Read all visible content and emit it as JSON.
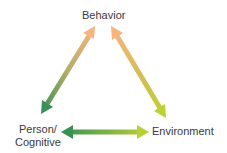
{
  "diagram": {
    "type": "triangle-reciprocal-determinism",
    "nodes": {
      "top": "Behavior",
      "left_line1": "Person/",
      "left_line2": "Cognitive",
      "right": "Environment"
    },
    "edges": [
      {
        "from": "Behavior",
        "to": "Person/Cognitive",
        "direction": "bidirectional"
      },
      {
        "from": "Behavior",
        "to": "Environment",
        "direction": "bidirectional"
      },
      {
        "from": "Person/Cognitive",
        "to": "Environment",
        "direction": "bidirectional"
      }
    ],
    "colors": {
      "orange": "#f5b27a",
      "green": "#3f9a5a",
      "yellow_green": "#b8cf3a"
    }
  }
}
